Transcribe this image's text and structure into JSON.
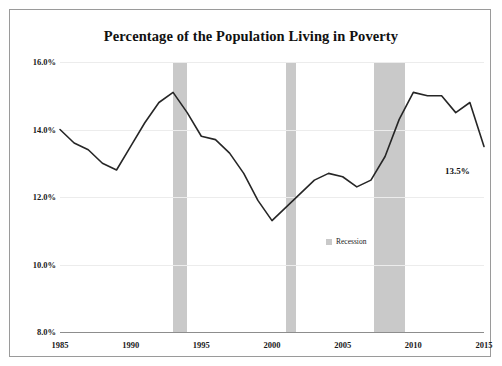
{
  "chart_data": {
    "type": "line",
    "title": "Percentage of the Population Living in Poverty",
    "xlabel": "",
    "ylabel": "",
    "grid": true,
    "legend_position": "inside-right",
    "xlim": [
      1985,
      2015
    ],
    "ylim": [
      8.0,
      16.0
    ],
    "ytick_labels": [
      "16.0%",
      "14.0%",
      "12.0%",
      "10.0%",
      "8.0%"
    ],
    "ytick_values": [
      16.0,
      14.0,
      12.0,
      10.0,
      8.0
    ],
    "xtick_labels": [
      "1985",
      "1990",
      "1995",
      "2000",
      "2005",
      "2010",
      "2015"
    ],
    "xtick_values": [
      1985,
      1990,
      1995,
      2000,
      2005,
      2010,
      2015
    ],
    "series": [
      {
        "name": "Poverty rate",
        "color": "#262626",
        "x": [
          1985,
          1986,
          1987,
          1988,
          1989,
          1990,
          1991,
          1992,
          1993,
          1994,
          1995,
          1996,
          1997,
          1998,
          1999,
          2000,
          2001,
          2002,
          2003,
          2004,
          2005,
          2006,
          2007,
          2008,
          2009,
          2010,
          2011,
          2012,
          2013,
          2014,
          2015
        ],
        "values": [
          14.0,
          13.6,
          13.4,
          13.0,
          12.8,
          13.5,
          14.2,
          14.8,
          15.1,
          14.5,
          13.8,
          13.7,
          13.3,
          12.7,
          11.9,
          11.3,
          11.7,
          12.1,
          12.5,
          12.7,
          12.6,
          12.3,
          12.5,
          13.2,
          14.3,
          15.1,
          15.0,
          15.0,
          14.5,
          14.8,
          13.5
        ]
      }
    ],
    "annotations": [
      {
        "name": "end-value-label",
        "text": "13.5%",
        "x": 2015,
        "y": 13.5
      }
    ],
    "shaded_regions": [
      {
        "label": "Recession",
        "start": 1990,
        "end": 1991,
        "color": "#c9c9c9"
      },
      {
        "label": "Recession",
        "start": 2001,
        "end": 2001.7,
        "color": "#c9c9c9"
      },
      {
        "label": "Recession",
        "start": 2007.2,
        "end": 2009.4,
        "color": "#c9c9c9"
      }
    ],
    "legend": [
      {
        "label": "Recession",
        "color": "#c9c9c9"
      }
    ]
  },
  "colors": {
    "line": "#262626",
    "recession_band": "#c9c9c9",
    "grid": "#ececec",
    "axis": "#8d8d8d",
    "frame_border": "#9a9a9a",
    "text": "#1a1a1a",
    "background": "#ffffff"
  }
}
